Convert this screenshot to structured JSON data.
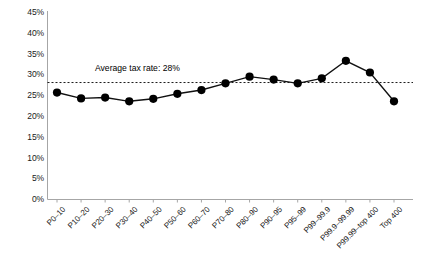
{
  "chart_data": {
    "type": "line",
    "title": "",
    "subtitle": "",
    "xlabel": "",
    "ylabel": "",
    "categories": [
      "P0–10",
      "P10–20",
      "P20–30",
      "P30–40",
      "P40–50",
      "P50–60",
      "P60–70",
      "P70–80",
      "P80–90",
      "P90–95",
      "P95–99",
      "P99–99.9",
      "P99.9–99.99",
      "P99.99–top 400",
      "Top 400"
    ],
    "values": [
      25.6,
      24.2,
      24.4,
      23.5,
      24.1,
      25.3,
      26.2,
      27.8,
      29.4,
      28.7,
      27.8,
      29.0,
      33.2,
      30.4,
      23.5
    ],
    "series": [
      {
        "name": "Effective tax rate",
        "values": [
          25.6,
          24.2,
          24.4,
          23.5,
          24.1,
          25.3,
          26.2,
          27.8,
          29.4,
          28.7,
          27.8,
          29.0,
          33.2,
          30.4,
          23.5
        ]
      }
    ],
    "ylim": [
      0,
      45
    ],
    "ytick_step": 5,
    "ytick_labels": [
      "0%",
      "5%",
      "10%",
      "15%",
      "20%",
      "25%",
      "30%",
      "35%",
      "40%",
      "45%"
    ],
    "ytick_values": [
      0,
      5,
      10,
      15,
      20,
      25,
      30,
      35,
      40,
      45
    ],
    "grid": false,
    "legend": "none",
    "annotations": [
      {
        "name": "average-tax-rate",
        "text": "Average tax rate: 28%",
        "value": 28,
        "style": "dashed-horizontal-line"
      }
    ],
    "colors": {
      "line": "#000000",
      "marker": "#000000",
      "reference_line": "#000000",
      "axis": "#9a9a9a",
      "background": "#ffffff"
    }
  }
}
